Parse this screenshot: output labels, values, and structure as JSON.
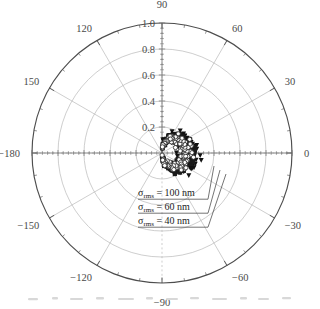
{
  "chart_data": {
    "type": "polar-scatter",
    "title": "",
    "subtitle": "",
    "xlabel": "",
    "ylabel": "",
    "grid": true,
    "legend_position": "inside-lower-left",
    "radial_axis": {
      "label": "",
      "min": 0.0,
      "max": 1.0,
      "ticks": [
        0.2,
        0.4,
        0.6,
        0.8,
        1.0
      ],
      "tick_labels": [
        "0.2",
        "0.4",
        "0.6",
        "0.8",
        "1.0"
      ],
      "tick_label_angle_deg": 90
    },
    "angular_axis": {
      "label": "",
      "unit": "degrees",
      "min": -180,
      "max": 180,
      "direction": "counterclockwise",
      "zero_location": "E",
      "ticks": [
        0,
        30,
        60,
        90,
        120,
        150,
        180,
        -150,
        -120,
        -90,
        -60,
        -30
      ],
      "tick_labels": [
        "0",
        "30",
        "60",
        "90",
        "120",
        "150",
        "−180",
        "−150",
        "−120",
        "−90",
        "−60",
        "−30"
      ],
      "minor_tick_step_deg": 10
    },
    "series": [
      {
        "name": "σrms = 100 nm",
        "label": "σ",
        "label_sub": "rms",
        "label_rest": " = 100 nm",
        "marker": "triangle-down-filled",
        "marker_symbol": "▼",
        "color": "#111111",
        "sigma_nm": 100,
        "peak_radius": 0.225,
        "scatter_spread": 0.032,
        "n_points": 180,
        "lobe_exponent": 1.0
      },
      {
        "name": "σrms = 60 nm",
        "label": "σ",
        "label_sub": "rms",
        "label_rest": " = 60 nm",
        "marker": "square-filled",
        "marker_symbol": "■",
        "color": "#1a1a1a",
        "sigma_nm": 60,
        "peak_radius": 0.205,
        "scatter_spread": 0.026,
        "n_points": 170,
        "lobe_exponent": 1.0
      },
      {
        "name": "σrms = 40 nm",
        "label": "σ",
        "label_sub": "rms",
        "label_rest": " = 40 nm",
        "marker": "circle-open",
        "marker_symbol": "○",
        "color": "#2a2a2a",
        "sigma_nm": 40,
        "peak_radius": 0.188,
        "scatter_spread": 0.02,
        "n_points": 160,
        "lobe_exponent": 1.0
      }
    ],
    "model_curves": [
      {
        "name": "model-100nm",
        "peak_radius": 0.222,
        "color": "#555555"
      },
      {
        "name": "model-60nm",
        "peak_radius": 0.203,
        "color": "#666666"
      },
      {
        "name": "model-40nm",
        "peak_radius": 0.186,
        "color": "#777777"
      }
    ],
    "annotations": [
      {
        "id": "anno-100",
        "text": "σrms = 100 nm",
        "sym": "σ",
        "sub": "rms",
        "rest": " = 100 nm",
        "x": 138,
        "y": 196,
        "leader_to_x": 214,
        "leader_to_y": 166
      },
      {
        "id": "anno-60",
        "text": "σrms = 60 nm",
        "sym": "σ",
        "sub": "rms",
        "rest": " = 60 nm",
        "x": 138,
        "y": 210,
        "leader_to_x": 220,
        "leader_to_y": 170
      },
      {
        "id": "anno-40",
        "text": "σrms = 40 nm",
        "sym": "σ",
        "sub": "rms",
        "rest": " = 40 nm",
        "x": 138,
        "y": 224,
        "leader_to_x": 226,
        "leader_to_y": 174
      }
    ],
    "colors": {
      "outer_circle": "#4d4d4d",
      "grid": "#b9b9b9",
      "axis_line": "#6a6a6a",
      "text": "#4a4a4a",
      "data": "#111111",
      "background": "#ffffff"
    }
  },
  "figure": {
    "center_x": 162,
    "center_y": 153,
    "outer_radius": 130
  }
}
